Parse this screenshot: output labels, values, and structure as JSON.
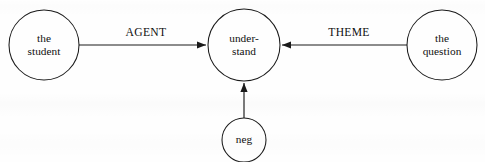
{
  "diagram": {
    "type": "semantic-dependency-graph",
    "width": 485,
    "height": 162,
    "background_color": "#fefefe",
    "stroke_color": "#1a1a1a",
    "text_color": "#101010",
    "nodes": [
      {
        "id": "student",
        "name": "node-student",
        "lines": [
          "the",
          "student"
        ],
        "cx": 44,
        "cy": 45,
        "r": 35
      },
      {
        "id": "understand",
        "name": "node-understand",
        "lines": [
          "under-",
          "stand"
        ],
        "cx": 244,
        "cy": 45,
        "r": 36
      },
      {
        "id": "question",
        "name": "node-question",
        "lines": [
          "the",
          "question"
        ],
        "cx": 442,
        "cy": 45,
        "r": 35
      },
      {
        "id": "neg",
        "name": "node-neg",
        "lines": [
          "neg"
        ],
        "cx": 244,
        "cy": 140,
        "r": 22
      }
    ],
    "edges": [
      {
        "id": "agent",
        "name": "edge-agent",
        "label": "AGENT",
        "from": "student",
        "to": "understand",
        "direction": "right",
        "label_x": 146,
        "label_y": 33,
        "x1": 79,
        "y1": 45,
        "x2": 206,
        "y2": 45
      },
      {
        "id": "theme",
        "name": "edge-theme",
        "label": "THEME",
        "from": "question",
        "to": "understand",
        "direction": "left",
        "label_x": 349,
        "label_y": 33,
        "x1": 407,
        "y1": 45,
        "x2": 282,
        "y2": 45
      },
      {
        "id": "neg-edge",
        "name": "edge-neg",
        "label": "",
        "from": "neg",
        "to": "understand",
        "direction": "up",
        "label_x": 0,
        "label_y": 0,
        "x1": 244,
        "y1": 118,
        "x2": 244,
        "y2": 83
      }
    ]
  }
}
